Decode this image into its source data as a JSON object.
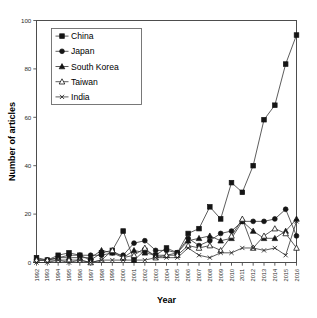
{
  "chart_data": {
    "type": "line",
    "title": "",
    "xlabel": "Year",
    "ylabel": "Number of articles",
    "xlim": [
      1992,
      2016
    ],
    "ylim": [
      0,
      100
    ],
    "ytick_values": [
      0,
      20,
      40,
      60,
      80,
      100
    ],
    "ytick_labels": [
      "0",
      "20",
      "40",
      "60",
      "80",
      "100"
    ],
    "grid": false,
    "legend_position": "top-left",
    "categories": [
      1992,
      1993,
      1994,
      1995,
      1996,
      1997,
      1998,
      1999,
      2000,
      2001,
      2002,
      2003,
      2004,
      2005,
      2006,
      2007,
      2008,
      2009,
      2010,
      2011,
      2012,
      2013,
      2014,
      2015,
      2016
    ],
    "xtick_labels": [
      "1992",
      "1993",
      "1994",
      "1995",
      "1996",
      "1997",
      "1998",
      "1999",
      "2000",
      "2001",
      "2002",
      "2003",
      "2004",
      "2005",
      "2006",
      "2007",
      "2008",
      "2009",
      "2010",
      "2011",
      "2012",
      "2013",
      "2014",
      "2015",
      "2016"
    ],
    "series": [
      {
        "name": "China",
        "marker": "filled-square",
        "values": [
          2,
          1,
          3,
          4,
          3,
          1,
          4,
          5,
          13,
          1,
          5,
          3,
          6,
          4,
          12,
          14,
          23,
          18,
          33,
          29,
          40,
          59,
          65,
          82,
          94
        ]
      },
      {
        "name": "Japan",
        "marker": "filled-circle",
        "values": [
          1,
          1,
          2,
          3,
          3,
          3,
          3,
          4,
          3,
          8,
          9,
          5,
          5,
          4,
          10,
          7,
          9,
          12,
          13,
          17,
          17,
          17,
          18,
          22,
          11
        ]
      },
      {
        "name": "South Korea",
        "marker": "filled-triangle",
        "values": [
          1,
          1,
          2,
          2,
          2,
          2,
          5,
          4,
          2,
          5,
          4,
          3,
          3,
          4,
          9,
          10,
          11,
          9,
          10,
          17,
          13,
          10,
          10,
          13,
          18
        ]
      },
      {
        "name": "Taiwan",
        "marker": "open-triangle",
        "values": [
          1,
          1,
          1,
          1,
          1,
          0,
          1,
          5,
          2,
          3,
          6,
          2,
          3,
          3,
          7,
          6,
          7,
          5,
          11,
          18,
          6,
          11,
          14,
          12,
          6
        ]
      },
      {
        "name": "India",
        "marker": "x",
        "values": [
          0,
          0,
          1,
          0,
          1,
          0,
          1,
          1,
          1,
          1,
          1,
          2,
          2,
          2,
          6,
          3,
          2,
          4,
          4,
          6,
          6,
          5,
          6,
          3,
          17
        ]
      }
    ]
  },
  "legend": {
    "items": [
      {
        "label": "China"
      },
      {
        "label": "Japan"
      },
      {
        "label": "South Korea"
      },
      {
        "label": "Taiwan"
      },
      {
        "label": "India"
      }
    ]
  }
}
